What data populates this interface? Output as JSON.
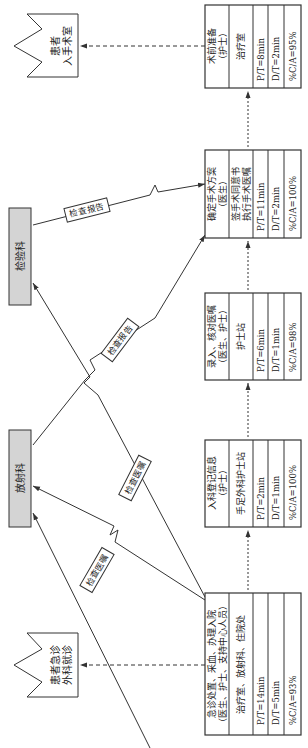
{
  "diagram": {
    "orientation": "rotated-90-ccw",
    "endpoints": {
      "start": {
        "line1": "患者急诊",
        "line2": "外科就诊"
      },
      "end": {
        "line1": "患者",
        "line2": "入手术室"
      }
    },
    "departments": {
      "lab": "检验科",
      "radiology": "放射科"
    },
    "flow_labels": {
      "exam_order_radiology": "检查医嘱",
      "exam_order_lab": "检查医嘱",
      "report_radiology": "检查报告",
      "report_lab": "检查报告"
    },
    "processes": [
      {
        "title1": "急诊处置、采血、办理入院",
        "title2": "（医生、护士、支持中心人员）",
        "location": "治疗室、放射科、住院处",
        "pt": "P/T=14min",
        "dt": "D/T=5min",
        "ca": "%C/A=93%"
      },
      {
        "title1": "入科登记信息",
        "title2": "（护士）",
        "location": "手足外科护士站",
        "pt": "P/T=2min",
        "dt": "D/T=1min",
        "ca": "%C/A=100%"
      },
      {
        "title1": "录入、核对医嘱",
        "title2": "（医生、护士）",
        "location": "护士站",
        "pt": "P/T=6min",
        "dt": "D/T=1min",
        "ca": "%C/A=98%"
      },
      {
        "title1": "确定手术方案",
        "title2": "（医生）",
        "location1": "签手术同意书",
        "location2": "执行手术医嘱",
        "pt": "P/T=11min",
        "dt": "D/T=2min",
        "ca": "%C/A=100%"
      },
      {
        "title1": "术前准备",
        "title2": "（护士）",
        "location": "治疗室",
        "pt": "P/T=8min",
        "dt": "D/T=2min",
        "ca": "%C/A=95%"
      }
    ],
    "colors": {
      "line": "#333333",
      "dept_fill": "#d4d4d4",
      "box_fill": "#ffffff"
    }
  }
}
